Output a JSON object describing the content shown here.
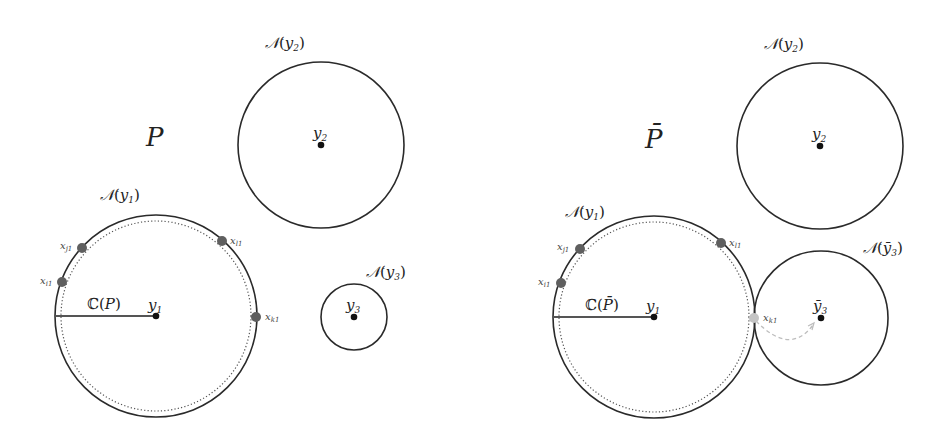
{
  "figure": {
    "colors": {
      "stroke": "#2a2a2a",
      "dark_point": "#5f5f5f",
      "light_point": "#c4c4c4",
      "move_arrow": "#bdbdbd"
    },
    "left_panel": {
      "title": "P",
      "n_y1": {
        "name": "𝒩",
        "open": "(",
        "var": "y",
        "sub": "1",
        "close": ")"
      },
      "n_y2": {
        "name": "𝒩",
        "open": "(",
        "var": "y",
        "sub": "2",
        "close": ")"
      },
      "n_y3": {
        "name": "𝒩",
        "open": "(",
        "var": "y",
        "sub": "3",
        "close": ")"
      },
      "y1": {
        "var": "y",
        "sub": "1"
      },
      "y2": {
        "var": "y",
        "sub": "2"
      },
      "y3": {
        "var": "y",
        "sub": "3"
      },
      "coverage": {
        "symbol": "ℂ",
        "open": "(",
        "var": "P",
        "close": ")"
      },
      "points": {
        "x_j1": {
          "var": "x",
          "sub": "j1"
        },
        "x_i1": {
          "var": "x",
          "sub": "i1"
        },
        "x_l1": {
          "var": "x",
          "sub": "l1"
        },
        "x_k1": {
          "var": "x",
          "sub": "k1"
        }
      }
    },
    "right_panel": {
      "title": "P̄",
      "n_y1": {
        "name": "𝒩",
        "open": "(",
        "var": "y",
        "sub": "1",
        "close": ")"
      },
      "n_y2": {
        "name": "𝒩",
        "open": "(",
        "var": "y",
        "sub": "2",
        "close": ")"
      },
      "n_y3": {
        "name": "𝒩",
        "open": "(",
        "var": "ȳ",
        "sub": "3",
        "close": ")"
      },
      "y1": {
        "var": "y",
        "sub": "1"
      },
      "y2": {
        "var": "y",
        "sub": "2"
      },
      "y3": {
        "var": "ȳ",
        "sub": "3"
      },
      "coverage": {
        "symbol": "ℂ",
        "open": "(",
        "var": "P̄",
        "close": ")"
      },
      "points": {
        "x_j1": {
          "var": "x",
          "sub": "j1"
        },
        "x_i1": {
          "var": "x",
          "sub": "i1"
        },
        "x_l1": {
          "var": "x",
          "sub": "l1"
        },
        "x_k1": {
          "var": "x",
          "sub": "k1"
        }
      }
    }
  }
}
